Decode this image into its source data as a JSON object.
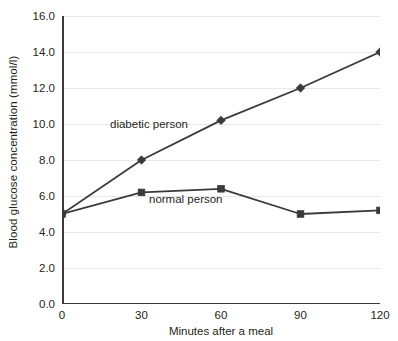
{
  "chart_data": {
    "type": "line",
    "title": "",
    "subtitle": "",
    "xlabel": "Minutes after a meal",
    "ylabel": "Blood glucose concentration (mmol/l)",
    "x": [
      0,
      30,
      60,
      90,
      120
    ],
    "xlim": [
      0,
      120
    ],
    "ylim": [
      0.0,
      16.0
    ],
    "xticks": [
      "0",
      "30",
      "60",
      "90",
      "120"
    ],
    "yticks": [
      "0.0",
      "2.0",
      "4.0",
      "6.0",
      "8.0",
      "10.0",
      "12.0",
      "14.0",
      "16.0"
    ],
    "ytick_values": [
      0.0,
      2.0,
      4.0,
      6.0,
      8.0,
      10.0,
      12.0,
      14.0,
      16.0
    ],
    "grid": "horizontal",
    "legend_position": "inline-annotations",
    "series": [
      {
        "name": "diabetic person",
        "marker": "diamond",
        "color": "#3a3a3a",
        "values": [
          5.0,
          8.0,
          10.2,
          12.0,
          14.0
        ],
        "annotation": "diabetic person"
      },
      {
        "name": "normal person",
        "marker": "square",
        "color": "#3a3a3a",
        "values": [
          5.0,
          6.2,
          6.4,
          5.0,
          5.2
        ],
        "annotation": "normal person"
      }
    ],
    "annotations": [
      {
        "text": "diabetic person",
        "x": 48,
        "y": 102
      },
      {
        "text": "normal person",
        "x": 87,
        "y": 177
      }
    ],
    "colors": {
      "axis": "#3b3b3b",
      "grid": "#e8e8e8",
      "line": "#3a3a3a",
      "text": "#231f20",
      "background": "#ffffff"
    }
  }
}
